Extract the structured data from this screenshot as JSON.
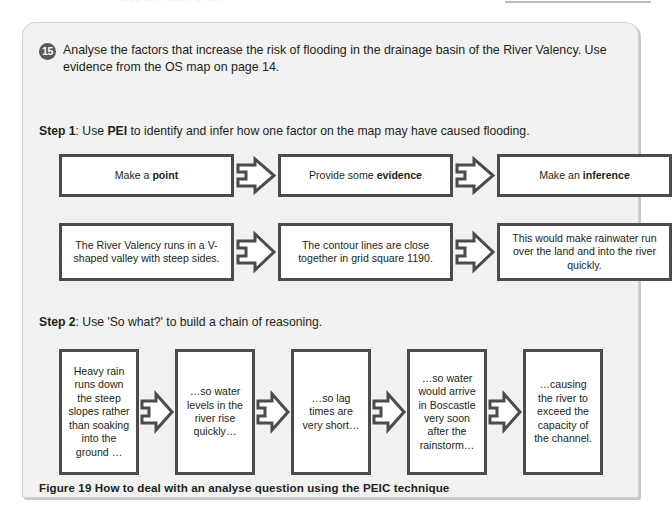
{
  "page": {
    "top_ghost_text": "clipped heading text"
  },
  "question": {
    "number": "15",
    "text": "Analyse the factors that increase the risk of flooding in the drainage basin of the River Valency. Use evidence from the OS map on page 14.",
    "badge_color": "#58595b"
  },
  "steps": [
    {
      "label": "Step 1",
      "heading_prefix": "Step 1",
      "heading_rest": ": Use ",
      "heading_bold2": "PEI",
      "heading_tail": " to identify and infer how one factor on the map may have caused flooding.",
      "rows": [
        {
          "name": "pei-labels",
          "boxes": [
            {
              "text_plain": "Make a ",
              "text_bold": "point",
              "text_tail": ""
            },
            {
              "text_plain": "Provide some ",
              "text_bold": "evidence",
              "text_tail": ""
            },
            {
              "text_plain": "Make an ",
              "text_bold": "inference",
              "text_tail": ""
            }
          ]
        },
        {
          "name": "pei-examples",
          "boxes": [
            {
              "text": "The River Valency runs in a V-shaped valley with steep sides."
            },
            {
              "text": "The contour lines are close together in grid square 1190."
            },
            {
              "text": "This would make rainwater run over the land and into the river quickly."
            }
          ]
        }
      ]
    },
    {
      "label": "Step 2",
      "heading_prefix": "Step 2",
      "heading_tail": ": Use 'So what?' to build a chain of reasoning.",
      "rows": [
        {
          "name": "reasoning-chain",
          "boxes": [
            {
              "text": "Heavy rain runs down the steep slopes rather than soaking into the ground …"
            },
            {
              "text": "…so water levels in the river rise quickly…"
            },
            {
              "text": "…so lag times are very short…"
            },
            {
              "text": "…so water would arrive in Boscastle very soon after the rainstorm…"
            },
            {
              "text": "…causing the river to exceed the capacity of the channel."
            }
          ]
        }
      ]
    }
  ],
  "caption": {
    "figure_number": "Figure 19",
    "text": "Figure 19 How to deal with an analyse question using the PEIC technique"
  },
  "colors": {
    "panel_background": "#f1f1ef",
    "box_border": "#4b4b4d",
    "text": "#231f20",
    "badge": "#58595b"
  }
}
